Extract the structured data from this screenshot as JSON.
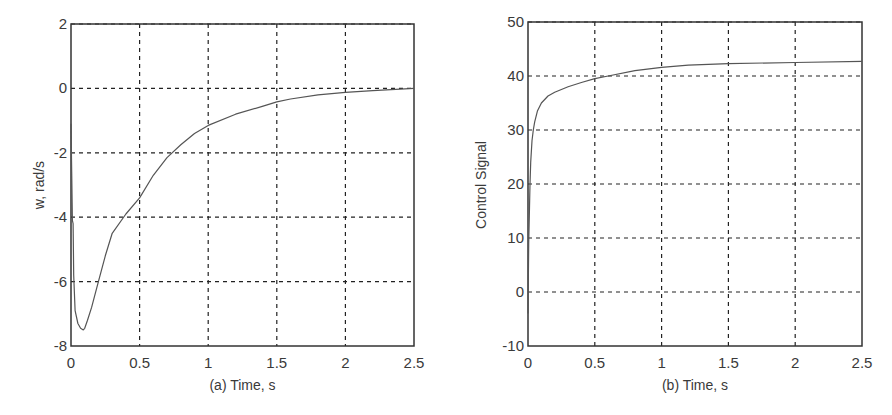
{
  "chart_data": [
    {
      "id": "a",
      "type": "line",
      "title": "",
      "xlabel": "(a) Time, s",
      "ylabel": "w, rad/s",
      "xlim": [
        0,
        2.5
      ],
      "ylim": [
        -8,
        2
      ],
      "xticks": [
        0,
        0.5,
        1,
        1.5,
        2,
        2.5
      ],
      "xtick_labels": [
        "0",
        "0.5",
        "1",
        "1.5",
        "2",
        "2.5"
      ],
      "yticks": [
        -8,
        -6,
        -4,
        -2,
        0,
        2
      ],
      "ytick_labels": [
        "-8",
        "-6",
        "-4",
        "-2",
        "0",
        "2"
      ],
      "grid": true,
      "grid_style": "dashed",
      "legend": null,
      "series": [
        {
          "name": "w",
          "color": "#555555",
          "x": [
            0,
            0.005,
            0.01,
            0.015,
            0.02,
            0.03,
            0.05,
            0.07,
            0.09,
            0.1,
            0.12,
            0.15,
            0.2,
            0.25,
            0.3,
            0.4,
            0.5,
            0.6,
            0.7,
            0.8,
            0.9,
            1.0,
            1.2,
            1.4,
            1.5,
            1.6,
            1.8,
            2.0,
            2.2,
            2.5
          ],
          "y": [
            -1.1,
            -2.6,
            -4.1,
            -4.2,
            -5.8,
            -6.9,
            -7.3,
            -7.45,
            -7.5,
            -7.45,
            -7.2,
            -6.8,
            -6.0,
            -5.2,
            -4.5,
            -3.9,
            -3.4,
            -2.7,
            -2.15,
            -1.75,
            -1.4,
            -1.15,
            -0.8,
            -0.55,
            -0.42,
            -0.33,
            -0.2,
            -0.12,
            -0.07,
            0.0
          ]
        }
      ]
    },
    {
      "id": "b",
      "type": "line",
      "title": "",
      "xlabel": "(b) Time, s",
      "ylabel": "Control Signal",
      "xlim": [
        0,
        2.5
      ],
      "ylim": [
        -10,
        50
      ],
      "xticks": [
        0,
        0.5,
        1,
        1.5,
        2,
        2.5
      ],
      "xtick_labels": [
        "0",
        "0.5",
        "1",
        "1.5",
        "2",
        "2.5"
      ],
      "yticks": [
        -10,
        0,
        10,
        20,
        30,
        40,
        50
      ],
      "ytick_labels": [
        "-10",
        "0",
        "10",
        "20",
        "30",
        "40",
        "50"
      ],
      "grid": true,
      "grid_style": "dashed",
      "legend": null,
      "series": [
        {
          "name": "u",
          "color": "#555555",
          "x": [
            0,
            0.005,
            0.01,
            0.015,
            0.02,
            0.03,
            0.04,
            0.05,
            0.07,
            0.1,
            0.15,
            0.2,
            0.3,
            0.4,
            0.5,
            0.6,
            0.8,
            1.0,
            1.2,
            1.5,
            2.0,
            2.5
          ],
          "y": [
            -4,
            9,
            14,
            20,
            24,
            28,
            30,
            31.5,
            33.5,
            35,
            36.3,
            37,
            38,
            38.8,
            39.5,
            40.0,
            41.0,
            41.6,
            42.0,
            42.3,
            42.5,
            42.7
          ]
        }
      ]
    }
  ]
}
